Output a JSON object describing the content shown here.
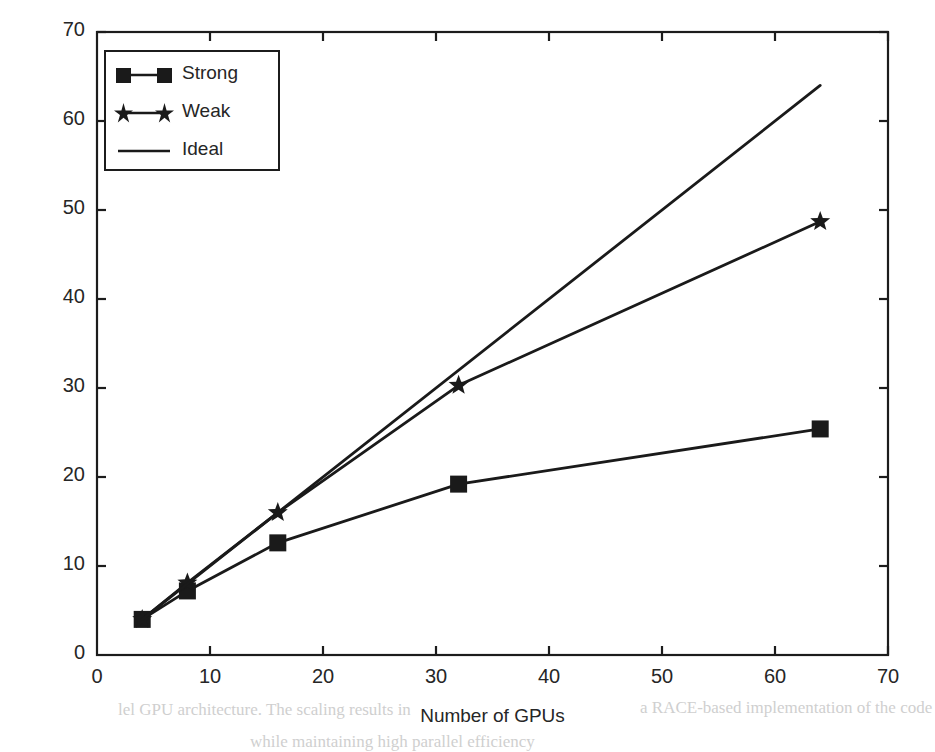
{
  "chart_data": {
    "type": "line",
    "title": "",
    "xlabel": "Number of GPUs",
    "ylabel": "Normalized performance",
    "xlim": [
      0,
      70
    ],
    "ylim": [
      0,
      70
    ],
    "xticks": [
      0,
      10,
      20,
      30,
      40,
      50,
      60,
      70
    ],
    "yticks": [
      0,
      10,
      20,
      30,
      40,
      50,
      60,
      70
    ],
    "grid": false,
    "legend_position": "upper left",
    "line_color": "#1a1a1a",
    "series": [
      {
        "name": "Strong",
        "marker": "square",
        "x": [
          4,
          8,
          16,
          32,
          64
        ],
        "values": [
          4.0,
          7.2,
          12.6,
          19.2,
          25.4
        ]
      },
      {
        "name": "Weak",
        "marker": "star",
        "x": [
          4,
          8,
          16,
          32,
          64
        ],
        "values": [
          4.0,
          8.1,
          16.0,
          30.3,
          48.7
        ]
      },
      {
        "name": "Ideal",
        "marker": "none",
        "x": [
          4,
          64
        ],
        "values": [
          4.0,
          64.0
        ]
      }
    ]
  },
  "legend": {
    "entries": [
      {
        "label": "Strong",
        "marker": "square"
      },
      {
        "label": "Weak",
        "marker": "star"
      },
      {
        "label": "Ideal",
        "marker": "none"
      }
    ]
  },
  "scan_artifacts": {
    "lines": [
      "lel GPU architecture. The scaling results in",
      "a RACE-based implementation of the code",
      "while maintaining high parallel efficiency"
    ]
  }
}
